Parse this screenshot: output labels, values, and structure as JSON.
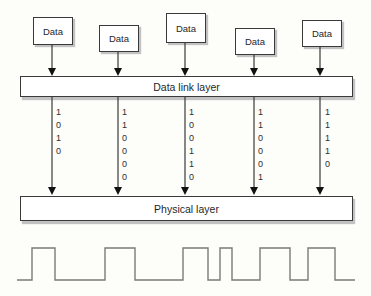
{
  "figure": {
    "boxes": [
      {
        "label": "Data"
      },
      {
        "label": "Data"
      },
      {
        "label": "Data"
      },
      {
        "label": "Data"
      },
      {
        "label": "Data"
      }
    ],
    "layers": {
      "data_link": {
        "label": "Data link layer"
      },
      "physical": {
        "label": "Physical layer"
      }
    },
    "streams": [
      {
        "bits": "1010"
      },
      {
        "bits": "110000"
      },
      {
        "bits": "100110"
      },
      {
        "bits": "110001"
      },
      {
        "bits": "11110"
      }
    ],
    "waveform": {
      "start_level": "low",
      "transitions_x": [
        17,
        32,
        55,
        105,
        135,
        183,
        208,
        220,
        232,
        260,
        290,
        308,
        335,
        355
      ],
      "high_y": 248,
      "low_y": 280
    },
    "colors": {
      "line": "#3a3a3a",
      "arrow_fill": "#111111",
      "waveform": "#7a7a7a",
      "box_shadow": "#c2c2c2",
      "background": "#fdfdfa",
      "text": "#1f1f1f"
    }
  }
}
